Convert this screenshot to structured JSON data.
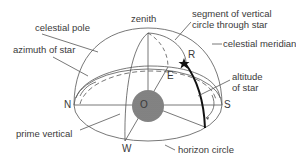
{
  "diagram": {
    "labels": {
      "zenith": "zenith",
      "celestial_pole": "celestial pole",
      "azimuth_of_star": "azimuth of star",
      "segment_line1": "segment of vertical",
      "segment_line2": "circle through star",
      "celestial_meridian": "celestial meridian",
      "altitude_line1": "altitude",
      "altitude_line2": "of star",
      "prime_vertical": "prime vertical",
      "horizon_circle": "horizon circle"
    },
    "points": {
      "north": "N",
      "south": "S",
      "east": "E",
      "west": "W",
      "observer": "O",
      "star": "R"
    },
    "colors": {
      "line": "#555555",
      "text": "#3a3a3a",
      "earth": "#8a8a8a",
      "star_arc": "#111111"
    }
  }
}
